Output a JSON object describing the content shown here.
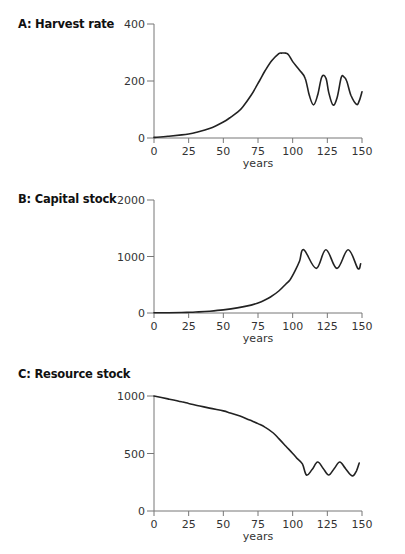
{
  "chart_data": [
    {
      "type": "line",
      "title": "A: Harvest rate",
      "xlabel": "years",
      "ylabel": "",
      "xlim": [
        0,
        150
      ],
      "ylim": [
        0,
        400
      ],
      "xticks": [
        0,
        25,
        50,
        75,
        100,
        125,
        150
      ],
      "yticks": [
        0,
        200,
        400
      ],
      "grid": false,
      "legend": null,
      "series": [
        {
          "name": "Harvest rate",
          "x": [
            0,
            10,
            20,
            25,
            30,
            40,
            50,
            55,
            60,
            64,
            70,
            76,
            80,
            85,
            90,
            92,
            95,
            97,
            100,
            105,
            109,
            112,
            115,
            118,
            121,
            124,
            126,
            129,
            132,
            135,
            137,
            139,
            142,
            146,
            148,
            150
          ],
          "values": [
            2,
            6,
            11,
            14,
            19,
            33,
            56,
            72,
            90,
            109,
            150,
            200,
            235,
            272,
            296,
            298,
            298,
            292,
            268,
            238,
            210,
            150,
            116,
            150,
            214,
            210,
            160,
            116,
            140,
            212,
            214,
            200,
            150,
            118,
            130,
            162
          ]
        }
      ]
    },
    {
      "type": "line",
      "title": "B: Capital stock",
      "xlabel": "years",
      "ylabel": "",
      "xlim": [
        0,
        150
      ],
      "ylim": [
        0,
        2000
      ],
      "xticks": [
        0,
        25,
        50,
        75,
        100,
        125,
        150
      ],
      "yticks": [
        0,
        1000,
        2000
      ],
      "grid": false,
      "legend": null,
      "series": [
        {
          "name": "Capital stock",
          "x": [
            0,
            10,
            20,
            25,
            30,
            40,
            50,
            60,
            70,
            75,
            80,
            84,
            90,
            95,
            98,
            102,
            105,
            108,
            117,
            124,
            132,
            140,
            147,
            149
          ],
          "values": [
            3,
            4,
            8,
            12,
            18,
            32,
            55,
            90,
            140,
            177,
            230,
            283,
            390,
            510,
            584,
            760,
            920,
            1120,
            790,
            1120,
            790,
            1120,
            790,
            870
          ]
        }
      ]
    },
    {
      "type": "line",
      "title": "C: Resource stock",
      "xlabel": "years",
      "ylabel": "",
      "xlim": [
        0,
        150
      ],
      "ylim": [
        0,
        1000
      ],
      "xticks": [
        0,
        25,
        50,
        75,
        100,
        125,
        150
      ],
      "yticks": [
        0,
        500,
        1000
      ],
      "grid": false,
      "legend": null,
      "series": [
        {
          "name": "Resource stock",
          "x": [
            0,
            10,
            20,
            25,
            33,
            40,
            50,
            55,
            62,
            69,
            75,
            80,
            86,
            90,
            95,
            100,
            103,
            107,
            110,
            114,
            118,
            122,
            126,
            130,
            134,
            138,
            143,
            146,
            148
          ],
          "values": [
            1000,
            975,
            950,
            935,
            913,
            895,
            870,
            852,
            825,
            791,
            760,
            730,
            678,
            630,
            565,
            500,
            460,
            410,
            313,
            360,
            426,
            370,
            313,
            370,
            426,
            370,
            305,
            350,
            417
          ]
        }
      ]
    }
  ],
  "panels": [
    {
      "title": "A: Harvest rate",
      "xlabel": "years",
      "yticks": [
        "0",
        "200",
        "400"
      ],
      "xticks": [
        "0",
        "25",
        "50",
        "75",
        "100",
        "125",
        "150"
      ]
    },
    {
      "title": "B: Capital stock",
      "xlabel": "years",
      "yticks": [
        "0",
        "1000",
        "2000"
      ],
      "xticks": [
        "0",
        "25",
        "50",
        "75",
        "100",
        "125",
        "150"
      ]
    },
    {
      "title": "C: Resource stock",
      "xlabel": "years",
      "yticks": [
        "0",
        "500",
        "1000"
      ],
      "xticks": [
        "0",
        "25",
        "50",
        "75",
        "100",
        "125",
        "150"
      ]
    }
  ],
  "colors": {
    "line": "#222222",
    "axis": "#777777",
    "text": "#1a1a1a"
  }
}
